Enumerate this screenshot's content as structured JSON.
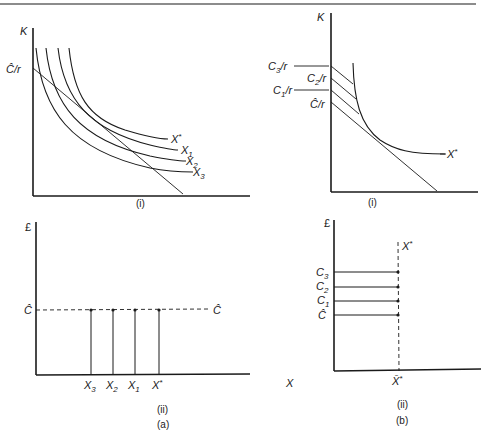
{
  "figure": {
    "panels": [
      {
        "id": "a-i",
        "caption": "(i)",
        "y_axis_label": "K",
        "intercept_label": "Ĉ/r",
        "curves": [
          {
            "name": "X*",
            "base": "X",
            "sup": "*"
          },
          {
            "name": "X1",
            "base": "X",
            "sub": "1"
          },
          {
            "name": "X2",
            "base": "X",
            "sub": "2"
          },
          {
            "name": "X3",
            "base": "X",
            "sub": "3"
          }
        ]
      },
      {
        "id": "b-i",
        "caption": "(i)",
        "y_axis_label": "K",
        "intercepts": [
          {
            "name": "C3/r",
            "base": "C",
            "sub": "3",
            "tail": "/r"
          },
          {
            "name": "C2/r",
            "base": "C",
            "sub": "2",
            "tail": "/r"
          },
          {
            "name": "C1/r",
            "base": "C",
            "sub": "1",
            "tail": "/r"
          },
          {
            "name": "Ĉ/r",
            "base": "Ĉ",
            "tail": "/r"
          }
        ],
        "curve": {
          "name": "X*",
          "base": "X",
          "sup": "*"
        }
      },
      {
        "id": "a-ii",
        "caption": "(ii)",
        "group_label": "(a)",
        "y_axis_label": "£",
        "x_axis_label": "X",
        "cost_level_left": "Ĉ",
        "cost_level_right": "Ĉ",
        "outputs": [
          {
            "name": "X3",
            "base": "X",
            "sub": "3"
          },
          {
            "name": "X2",
            "base": "X",
            "sub": "2"
          },
          {
            "name": "X1",
            "base": "X",
            "sub": "1"
          },
          {
            "name": "X*",
            "base": "X",
            "sup": "*"
          }
        ]
      },
      {
        "id": "b-ii",
        "caption": "(ii)",
        "group_label": "(b)",
        "y_axis_label": "£",
        "fixed_output_top": {
          "base": "X",
          "sup": "*"
        },
        "fixed_output_axis": {
          "base": "X̄",
          "sup": "*"
        },
        "cost_levels": [
          {
            "name": "C3",
            "base": "C",
            "sub": "3"
          },
          {
            "name": "C2",
            "base": "C",
            "sub": "2"
          },
          {
            "name": "C1",
            "base": "C",
            "sub": "1"
          },
          {
            "name": "Ĉ",
            "base": "Ĉ"
          }
        ]
      }
    ]
  },
  "colors": {
    "ink": "#1a1a1a",
    "background": "#ffffff"
  }
}
